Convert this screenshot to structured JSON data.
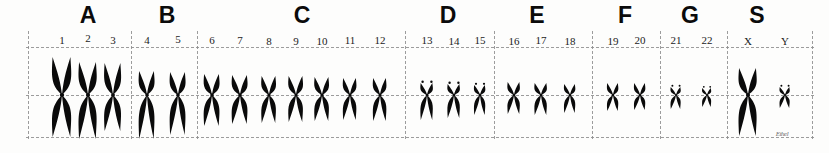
{
  "figure": {
    "kind": "human-karyotype",
    "background_color": "#fdfdfc",
    "ink_color": "#0a0a0a",
    "grid_color": "#8c8c8c",
    "width": 829,
    "height": 153,
    "signature_text": "Ethel"
  },
  "grid": {
    "hlines": [
      {
        "name": "top-rule",
        "y": 47,
        "x": 26,
        "w": 788
      },
      {
        "name": "centromere-rule",
        "y": 95,
        "x": 26,
        "w": 788
      },
      {
        "name": "bottom-rule",
        "y": 137,
        "x": 26,
        "w": 788
      }
    ],
    "vlines": [
      {
        "name": "left-border",
        "x": 28,
        "y": 31,
        "h": 108
      },
      {
        "name": "divider-a-b",
        "x": 131,
        "y": 31,
        "h": 108
      },
      {
        "name": "divider-b-c",
        "x": 197,
        "y": 31,
        "h": 108
      },
      {
        "name": "divider-c-d",
        "x": 405,
        "y": 31,
        "h": 108
      },
      {
        "name": "divider-d-e",
        "x": 494,
        "y": 31,
        "h": 108
      },
      {
        "name": "divider-e-f",
        "x": 592,
        "y": 31,
        "h": 108
      },
      {
        "name": "divider-f-g",
        "x": 660,
        "y": 31,
        "h": 108
      },
      {
        "name": "divider-g-s",
        "x": 727,
        "y": 31,
        "h": 108
      },
      {
        "name": "right-border",
        "x": 812,
        "y": 31,
        "h": 108
      }
    ]
  },
  "groups": [
    {
      "id": "A",
      "letter": "A",
      "letter_x": 88,
      "members": [
        "1",
        "2",
        "3"
      ]
    },
    {
      "id": "B",
      "letter": "B",
      "letter_x": 167,
      "members": [
        "4",
        "5"
      ]
    },
    {
      "id": "C",
      "letter": "C",
      "letter_x": 302,
      "members": [
        "6",
        "7",
        "8",
        "9",
        "10",
        "11",
        "12"
      ]
    },
    {
      "id": "D",
      "letter": "D",
      "letter_x": 448,
      "members": [
        "13",
        "14",
        "15"
      ]
    },
    {
      "id": "E",
      "letter": "E",
      "letter_x": 537,
      "members": [
        "16",
        "17",
        "18"
      ]
    },
    {
      "id": "F",
      "letter": "F",
      "letter_x": 625,
      "members": [
        "19",
        "20"
      ]
    },
    {
      "id": "G",
      "letter": "G",
      "letter_x": 690,
      "members": [
        "21",
        "22"
      ]
    },
    {
      "id": "S",
      "letter": "S",
      "letter_x": 757,
      "members": [
        "X",
        "Y"
      ]
    }
  ],
  "chromosomes": [
    {
      "label": "1",
      "group": "A",
      "x": 62,
      "label_x": 62,
      "label_y": 44,
      "arm_w": 17,
      "upper": 38,
      "lower": 42,
      "shape": "metacentric"
    },
    {
      "label": "2",
      "group": "A",
      "x": 88,
      "label_x": 88,
      "label_y": 42,
      "arm_w": 16,
      "upper": 33,
      "lower": 44,
      "shape": "submetacentric"
    },
    {
      "label": "3",
      "group": "A",
      "x": 113,
      "label_x": 113,
      "label_y": 44,
      "arm_w": 15,
      "upper": 32,
      "lower": 36,
      "shape": "metacentric"
    },
    {
      "label": "4",
      "group": "B",
      "x": 147,
      "label_x": 147,
      "label_y": 44,
      "arm_w": 14,
      "upper": 24,
      "lower": 44,
      "shape": "submetacentric"
    },
    {
      "label": "5",
      "group": "B",
      "x": 178,
      "label_x": 178,
      "label_y": 43,
      "arm_w": 14,
      "upper": 23,
      "lower": 40,
      "shape": "submetacentric"
    },
    {
      "label": "6",
      "group": "C",
      "x": 212,
      "label_x": 212,
      "label_y": 44,
      "arm_w": 14,
      "upper": 21,
      "lower": 31,
      "shape": "submetacentric"
    },
    {
      "label": "7",
      "group": "C",
      "x": 240,
      "label_x": 240,
      "label_y": 44,
      "arm_w": 14,
      "upper": 20,
      "lower": 29,
      "shape": "submetacentric"
    },
    {
      "label": "8",
      "group": "C",
      "x": 269,
      "label_x": 269,
      "label_y": 45,
      "arm_w": 13,
      "upper": 19,
      "lower": 28,
      "shape": "submetacentric"
    },
    {
      "label": "9",
      "group": "C",
      "x": 296,
      "label_x": 296,
      "label_y": 45,
      "arm_w": 13,
      "upper": 19,
      "lower": 27,
      "shape": "submetacentric"
    },
    {
      "label": "10",
      "group": "C",
      "x": 322,
      "label_x": 322,
      "label_y": 45,
      "arm_w": 13,
      "upper": 18,
      "lower": 26,
      "shape": "submetacentric"
    },
    {
      "label": "11",
      "group": "C",
      "x": 350,
      "label_x": 350,
      "label_y": 44,
      "arm_w": 12,
      "upper": 17,
      "lower": 25,
      "shape": "submetacentric"
    },
    {
      "label": "12",
      "group": "C",
      "x": 380,
      "label_x": 380,
      "label_y": 44,
      "arm_w": 12,
      "upper": 17,
      "lower": 26,
      "shape": "submetacentric"
    },
    {
      "label": "13",
      "group": "D",
      "x": 427,
      "label_x": 427,
      "label_y": 44,
      "arm_w": 11,
      "upper": 12,
      "lower": 25,
      "shape": "acrocentric"
    },
    {
      "label": "14",
      "group": "D",
      "x": 454,
      "label_x": 454,
      "label_y": 45,
      "arm_w": 11,
      "upper": 11,
      "lower": 23,
      "shape": "acrocentric"
    },
    {
      "label": "15",
      "group": "D",
      "x": 480,
      "label_x": 480,
      "label_y": 44,
      "arm_w": 10,
      "upper": 10,
      "lower": 20,
      "shape": "acrocentric"
    },
    {
      "label": "16",
      "group": "E",
      "x": 514,
      "label_x": 514,
      "label_y": 45,
      "arm_w": 11,
      "upper": 13,
      "lower": 19,
      "shape": "metacentric"
    },
    {
      "label": "17",
      "group": "E",
      "x": 541,
      "label_x": 541,
      "label_y": 44,
      "arm_w": 11,
      "upper": 12,
      "lower": 20,
      "shape": "submetacentric"
    },
    {
      "label": "18",
      "group": "E",
      "x": 570,
      "label_x": 570,
      "label_y": 45,
      "arm_w": 10,
      "upper": 11,
      "lower": 18,
      "shape": "submetacentric"
    },
    {
      "label": "19",
      "group": "F",
      "x": 613,
      "label_x": 613,
      "label_y": 45,
      "arm_w": 10,
      "upper": 12,
      "lower": 16,
      "shape": "metacentric"
    },
    {
      "label": "20",
      "group": "F",
      "x": 640,
      "label_x": 640,
      "label_y": 44,
      "arm_w": 10,
      "upper": 12,
      "lower": 15,
      "shape": "metacentric"
    },
    {
      "label": "21",
      "group": "G",
      "x": 676,
      "label_x": 676,
      "label_y": 44,
      "arm_w": 9,
      "upper": 8,
      "lower": 14,
      "shape": "acrocentric"
    },
    {
      "label": "22",
      "group": "G",
      "x": 707,
      "label_x": 707,
      "label_y": 44,
      "arm_w": 8,
      "upper": 7,
      "lower": 12,
      "shape": "acrocentric"
    },
    {
      "label": "X",
      "group": "S",
      "x": 748,
      "label_x": 748,
      "label_y": 45,
      "arm_w": 16,
      "upper": 27,
      "lower": 41,
      "shape": "submetacentric"
    },
    {
      "label": "Y",
      "group": "S",
      "x": 785,
      "label_x": 785,
      "label_y": 45,
      "arm_w": 9,
      "upper": 8,
      "lower": 13,
      "shape": "acrocentric"
    }
  ],
  "signature": {
    "text": "Ethel",
    "x": 782,
    "y": 130
  }
}
